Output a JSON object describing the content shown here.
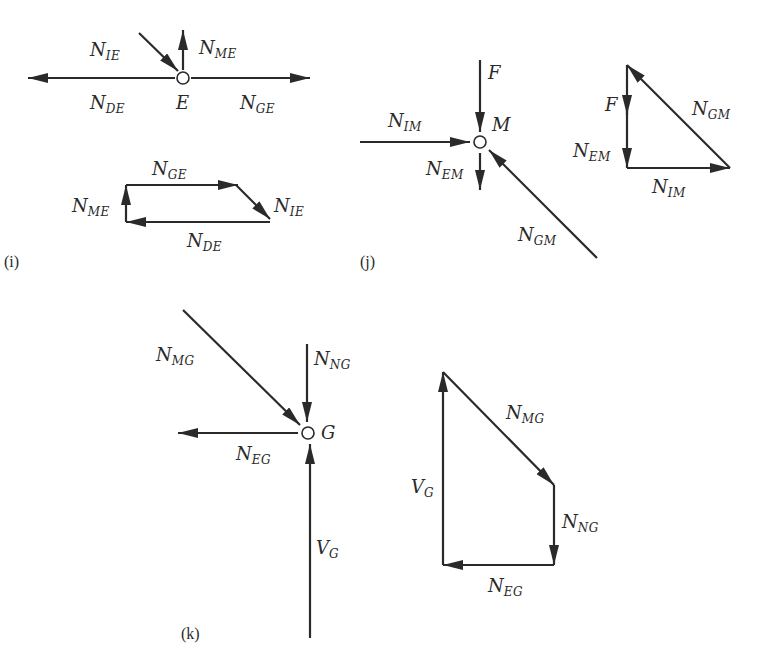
{
  "figure": {
    "panels": [
      {
        "id": "i",
        "caption": "(i)",
        "joint": "E",
        "free_body": {
          "node_label": "E",
          "forces": [
            {
              "name": "N",
              "sub": "IE",
              "direction": "toward joint, down-right"
            },
            {
              "name": "N",
              "sub": "ME",
              "direction": "up"
            },
            {
              "name": "N",
              "sub": "DE",
              "direction": "left"
            },
            {
              "name": "N",
              "sub": "GE",
              "direction": "right"
            }
          ]
        },
        "force_polygon": {
          "labels": [
            {
              "name": "N",
              "sub": "GE"
            },
            {
              "name": "N",
              "sub": "IE"
            },
            {
              "name": "N",
              "sub": "DE"
            },
            {
              "name": "N",
              "sub": "ME"
            }
          ]
        }
      },
      {
        "id": "j",
        "caption": "(j)",
        "joint": "M",
        "free_body": {
          "node_label": "M",
          "forces": [
            {
              "name": "F",
              "sub": "",
              "direction": "down"
            },
            {
              "name": "N",
              "sub": "IM",
              "direction": "right"
            },
            {
              "name": "N",
              "sub": "EM",
              "direction": "down"
            },
            {
              "name": "N",
              "sub": "GM",
              "direction": "up-left"
            }
          ]
        },
        "force_polygon": {
          "labels": [
            {
              "name": "F",
              "sub": ""
            },
            {
              "name": "N",
              "sub": "EM"
            },
            {
              "name": "N",
              "sub": "IM"
            },
            {
              "name": "N",
              "sub": "GM"
            }
          ]
        }
      },
      {
        "id": "k",
        "caption": "(k)",
        "joint": "G",
        "free_body": {
          "node_label": "G",
          "forces": [
            {
              "name": "N",
              "sub": "MG",
              "direction": "down-right"
            },
            {
              "name": "N",
              "sub": "NG",
              "direction": "down"
            },
            {
              "name": "N",
              "sub": "EG",
              "direction": "left"
            },
            {
              "name": "V",
              "sub": "G",
              "direction": "up"
            }
          ]
        },
        "force_polygon": {
          "labels": [
            {
              "name": "N",
              "sub": "MG"
            },
            {
              "name": "N",
              "sub": "NG"
            },
            {
              "name": "N",
              "sub": "EG"
            },
            {
              "name": "V",
              "sub": "G"
            }
          ]
        }
      }
    ],
    "colors": {
      "line": "#2a2a2a",
      "background": "#ffffff"
    }
  }
}
